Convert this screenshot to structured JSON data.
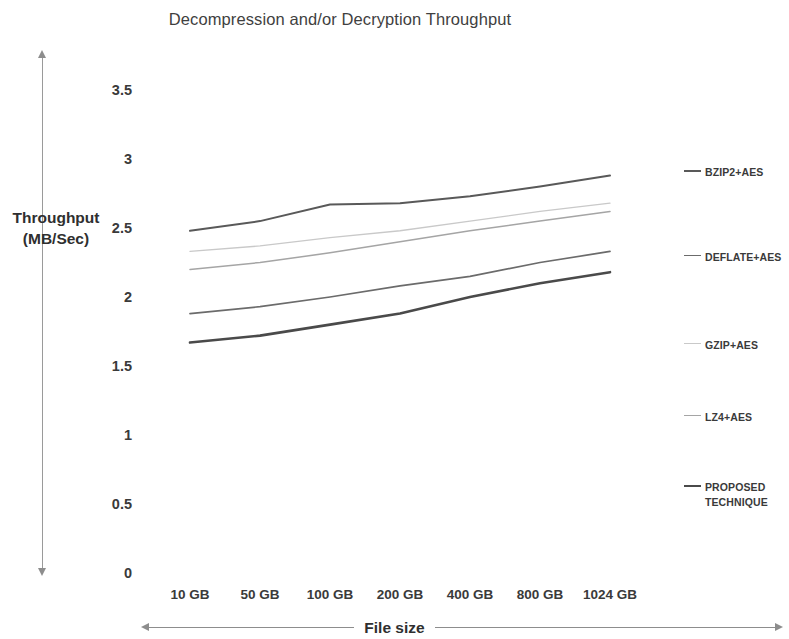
{
  "chart_data": {
    "type": "line",
    "title": "Decompression and/or Decryption Throughput",
    "xlabel": "File size",
    "ylabel": "Throughput (MB/Sec)",
    "ylabel_line1": "Throughput",
    "ylabel_line2": "(MB/Sec)",
    "categories": [
      "10 GB",
      "50 GB",
      "100 GB",
      "200 GB",
      "400 GB",
      "800 GB",
      "1024 GB"
    ],
    "ylim": [
      0,
      3.5
    ],
    "yticks": [
      "3.5",
      "3",
      "2.5",
      "2",
      "1.5",
      "1",
      "0.5",
      "0"
    ],
    "ytick_values": [
      3.5,
      3,
      2.5,
      2,
      1.5,
      1,
      0.5,
      0
    ],
    "grid": false,
    "legend_position": "right",
    "series": [
      {
        "name": "BZIP2+AES",
        "color": "#595959",
        "width": 2.0,
        "values": [
          2.48,
          2.55,
          2.67,
          2.68,
          2.73,
          2.8,
          2.88
        ]
      },
      {
        "name": "DEFLATE+AES",
        "color": "#6b6b6b",
        "width": 1.7,
        "values": [
          1.88,
          1.93,
          2.0,
          2.08,
          2.15,
          2.25,
          2.33
        ]
      },
      {
        "name": "GZIP+AES",
        "color": "#c9c9c9",
        "width": 1.3,
        "values": [
          2.33,
          2.37,
          2.43,
          2.48,
          2.55,
          2.62,
          2.68
        ]
      },
      {
        "name": "LZ4+AES",
        "color": "#a5a5a5",
        "width": 1.5,
        "values": [
          2.2,
          2.25,
          2.32,
          2.4,
          2.48,
          2.55,
          2.62
        ]
      },
      {
        "name": "PROPOSED\nTECHNIQUE",
        "color": "#4a4a4a",
        "width": 2.6,
        "values": [
          1.67,
          1.72,
          1.8,
          1.88,
          2.0,
          2.1,
          2.18
        ]
      }
    ]
  }
}
